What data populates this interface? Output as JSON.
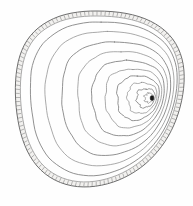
{
  "illustration": {
    "title": "Tree Trunk Cross-Section",
    "subject": "tree-ring-growth-rings",
    "style": "line-art-engraving",
    "caption": "",
    "canvas": {
      "width": 193,
      "height": 206
    },
    "colors": {
      "background": "#fefefe",
      "ring_stroke": "#7d7d7d",
      "ring_stroke_faint": "#8e8e8e",
      "bark_outline": "#6d6d6d",
      "bark_fill": "#f2f1ef",
      "bark_hatch": "#7a7a7a",
      "pith": "#1a1a1a"
    },
    "bark": {
      "label": "bark",
      "band_thickness_px": 5,
      "hatch_count": 132,
      "outer_bounds": {
        "left": 11,
        "top": 11,
        "right": 184,
        "bottom": 196
      }
    },
    "pith": {
      "label": "pith",
      "center_x": 152,
      "center_y": 98,
      "radius_x": 1.9,
      "radius_y": 2.6
    },
    "growth_rings": {
      "label": "growth rings",
      "count": 10,
      "eccentric": true,
      "note": "compressed on right side, widely spaced toward lower-left",
      "scales": [
        0.055,
        0.115,
        0.185,
        0.265,
        0.355,
        0.455,
        0.565,
        0.685,
        0.81,
        0.925
      ]
    },
    "geometry": {
      "outline_points": [
        [
          97,
          11
        ],
        [
          112,
          11.6
        ],
        [
          126,
          13.4
        ],
        [
          139,
          16.6
        ],
        [
          150.5,
          21.2
        ],
        [
          160.5,
          27.2
        ],
        [
          169,
          34.6
        ],
        [
          175.6,
          43.4
        ],
        [
          180.3,
          53.4
        ],
        [
          183.2,
          64.4
        ],
        [
          184.2,
          76.2
        ],
        [
          183.6,
          88.4
        ],
        [
          181.6,
          100.8
        ],
        [
          178.4,
          113
        ],
        [
          174,
          124.8
        ],
        [
          168.4,
          136
        ],
        [
          161.6,
          146.4
        ],
        [
          153.8,
          155.8
        ],
        [
          145,
          164.2
        ],
        [
          135.2,
          171.4
        ],
        [
          124.6,
          177.4
        ],
        [
          113.4,
          182
        ],
        [
          101.6,
          185.2
        ],
        [
          89.6,
          186.8
        ],
        [
          77.6,
          186.6
        ],
        [
          66,
          184.4
        ],
        [
          55.2,
          180.2
        ],
        [
          45.4,
          174
        ],
        [
          37,
          166
        ],
        [
          30.2,
          156.4
        ],
        [
          24.8,
          145.4
        ],
        [
          20.8,
          133.4
        ],
        [
          18,
          120.6
        ],
        [
          16.2,
          107.4
        ],
        [
          15.4,
          94
        ],
        [
          15.6,
          80.8
        ],
        [
          17,
          68
        ],
        [
          19.8,
          56
        ],
        [
          24.2,
          45.2
        ],
        [
          30.4,
          35.8
        ],
        [
          38.4,
          27.8
        ],
        [
          48,
          21.4
        ],
        [
          59,
          16.4
        ],
        [
          71,
          13.2
        ],
        [
          84,
          11.4
        ]
      ]
    }
  }
}
